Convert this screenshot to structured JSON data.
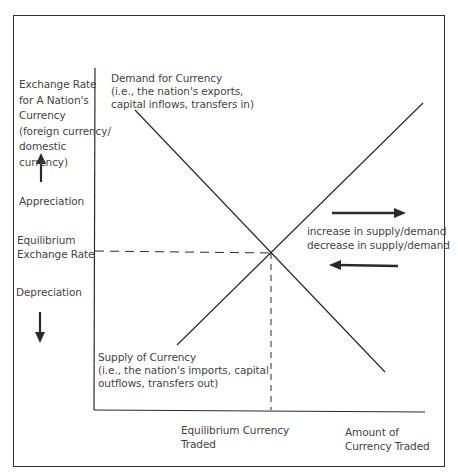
{
  "diagram": {
    "type": "supply-demand",
    "y_axis": {
      "title_lines": [
        "Exchange Rate",
        "for A Nation's",
        "Currency",
        "(foreign currency/",
        "domestic",
        "currency)"
      ],
      "appreciation": "Appreciation",
      "equilibrium_lines": [
        "Equilibrium",
        "Exchange Rate"
      ],
      "depreciation": "Depreciation"
    },
    "x_axis": {
      "equilibrium_lines": [
        "Equilibrium Currency",
        "Traded"
      ],
      "title_lines": [
        "Amount of",
        "Currency Traded"
      ]
    },
    "demand_curve": {
      "label_lines": [
        "Demand for Currency",
        "(i.e., the nation's exports,",
        "capital inflows, transfers in)"
      ]
    },
    "supply_curve": {
      "label_lines": [
        "Supply of Currency",
        "(i.e., the nation's imports, capital",
        "outflows, transfers out)"
      ]
    },
    "shift_legend": {
      "increase": "increase in supply/demand",
      "decrease": "decrease in supply/demand"
    },
    "colors": {
      "line": "#2a2a2a",
      "text": "#444444",
      "frame": "#2f2f2f"
    }
  }
}
